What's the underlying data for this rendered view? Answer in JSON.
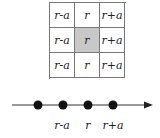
{
  "grid": {
    "rows": [
      [
        "r-a",
        "r",
        "r+a"
      ],
      [
        "r-a",
        "r",
        "r+a"
      ],
      [
        "r-a",
        "r",
        "r+a"
      ]
    ],
    "highlighted_cell": {
      "row": 1,
      "col": 1
    },
    "highlight_color": "#c8c8c8"
  },
  "number_line": {
    "points": 4,
    "labels": [
      {
        "text": "r-a",
        "x": 62
      },
      {
        "text": "r",
        "x": 88
      },
      {
        "text": "r+a",
        "x": 113
      }
    ]
  }
}
